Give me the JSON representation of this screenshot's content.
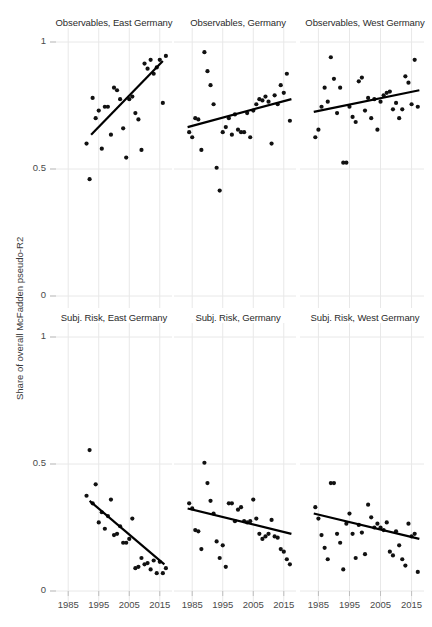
{
  "figure": {
    "width": 432,
    "height": 627,
    "background": "#ffffff",
    "point_color": "#111111",
    "line_color": "#000000",
    "grid_color": "#e8e8e8",
    "axis_color": "#bfbfbf"
  },
  "axes": {
    "ylabel": "Share of overall McFadden pseudo-R2",
    "yticks": [
      "0",
      "0.5",
      "1"
    ],
    "ytick_values": [
      0,
      0.5,
      1
    ],
    "ylim": [
      0,
      1.06
    ],
    "xticks": [
      "1985",
      "1995",
      "2005",
      "2015"
    ],
    "xtick_values": [
      1985,
      1995,
      2005,
      2015
    ],
    "xlim": [
      1981,
      2019
    ],
    "grid": true,
    "legend": "none"
  },
  "chart_data": {
    "type": "scatter",
    "title": "",
    "xlabel": "",
    "ylabel": "Share of overall McFadden pseudo-R2",
    "ylim": [
      0,
      1.06
    ],
    "xlim": [
      1981,
      2019
    ],
    "grid": true,
    "layout": {
      "rows": 2,
      "cols": 3
    },
    "panels": [
      {
        "title": "Observables, East Germany",
        "row": 0,
        "col": 0,
        "x": [
          1991,
          1992,
          1993,
          1994,
          1995,
          1996,
          1997,
          1998,
          1999,
          2000,
          2001,
          2002,
          2003,
          2004,
          2005,
          2006,
          2007,
          2008,
          2009,
          2010,
          2011,
          2012,
          2013,
          2014,
          2015,
          2016,
          2017
        ],
        "y": [
          0.6,
          0.46,
          0.78,
          0.7,
          0.73,
          0.58,
          0.745,
          0.745,
          0.635,
          0.82,
          0.81,
          0.775,
          0.66,
          0.545,
          0.775,
          0.785,
          0.72,
          0.695,
          0.575,
          0.915,
          0.895,
          0.93,
          0.875,
          0.9,
          0.93,
          0.76,
          0.945
        ],
        "trend": {
          "x0": 1992.5,
          "y0": 0.635,
          "x1": 2016.0,
          "y1": 0.925
        }
      },
      {
        "title": "Observables, Germany",
        "row": 0,
        "col": 1,
        "x": [
          1984,
          1985,
          1986,
          1987,
          1988,
          1989,
          1990,
          1991,
          1992,
          1993,
          1994,
          1995,
          1996,
          1997,
          1998,
          1999,
          2000,
          2001,
          2002,
          2003,
          2004,
          2005,
          2006,
          2007,
          2008,
          2009,
          2010,
          2011,
          2012,
          2013,
          2014,
          2015,
          2016,
          2017
        ],
        "y": [
          0.645,
          0.625,
          0.7,
          0.695,
          0.575,
          0.96,
          0.885,
          0.83,
          0.755,
          0.505,
          0.415,
          0.645,
          0.665,
          0.7,
          0.635,
          0.715,
          0.655,
          0.645,
          0.645,
          0.72,
          0.625,
          0.73,
          0.755,
          0.775,
          0.77,
          0.785,
          0.765,
          0.6,
          0.79,
          0.755,
          0.83,
          0.8,
          0.875,
          0.69
        ],
        "trend": {
          "x0": 1983.5,
          "y0": 0.665,
          "x1": 2017.5,
          "y1": 0.775
        }
      },
      {
        "title": "Observables, West Germany",
        "row": 0,
        "col": 2,
        "x": [
          1984,
          1985,
          1986,
          1987,
          1988,
          1989,
          1990,
          1991,
          1992,
          1993,
          1994,
          1995,
          1996,
          1997,
          1998,
          1999,
          2000,
          2001,
          2002,
          2003,
          2004,
          2005,
          2006,
          2007,
          2008,
          2009,
          2010,
          2011,
          2012,
          2013,
          2014,
          2015,
          2016,
          2017
        ],
        "y": [
          0.625,
          0.655,
          0.745,
          0.82,
          0.765,
          0.94,
          0.855,
          0.72,
          0.82,
          0.525,
          0.525,
          0.745,
          0.705,
          0.685,
          0.845,
          0.86,
          0.73,
          0.78,
          0.7,
          0.775,
          0.655,
          0.765,
          0.79,
          0.8,
          0.805,
          0.735,
          0.76,
          0.7,
          0.735,
          0.865,
          0.84,
          0.755,
          0.93,
          0.745
        ],
        "trend": {
          "x0": 1983.5,
          "y0": 0.725,
          "x1": 2017.5,
          "y1": 0.81
        }
      },
      {
        "title": "Subj. Risk, East Germany",
        "row": 1,
        "col": 0,
        "x": [
          1991,
          1992,
          1993,
          1994,
          1995,
          1996,
          1997,
          1998,
          1999,
          2000,
          2001,
          2002,
          2003,
          2004,
          2005,
          2006,
          2007,
          2008,
          2009,
          2010,
          2011,
          2012,
          2013,
          2014,
          2015,
          2016,
          2017
        ],
        "y": [
          0.375,
          0.555,
          0.345,
          0.42,
          0.27,
          0.31,
          0.245,
          0.295,
          0.36,
          0.22,
          0.225,
          0.255,
          0.19,
          0.19,
          0.205,
          0.285,
          0.09,
          0.095,
          0.13,
          0.105,
          0.11,
          0.085,
          0.12,
          0.07,
          0.115,
          0.07,
          0.09
        ],
        "trend": {
          "x0": 1992.0,
          "y0": 0.355,
          "x1": 2016.5,
          "y1": 0.105
        }
      },
      {
        "title": "Subj. Risk, Germany",
        "row": 1,
        "col": 1,
        "x": [
          1984,
          1985,
          1986,
          1987,
          1988,
          1989,
          1990,
          1991,
          1992,
          1993,
          1994,
          1995,
          1996,
          1997,
          1998,
          1999,
          2000,
          2001,
          2002,
          2003,
          2004,
          2005,
          2006,
          2007,
          2008,
          2009,
          2010,
          2011,
          2012,
          2013,
          2014,
          2015,
          2016,
          2017
        ],
        "y": [
          0.345,
          0.325,
          0.24,
          0.235,
          0.165,
          0.505,
          0.425,
          0.355,
          0.305,
          0.195,
          0.13,
          0.18,
          0.095,
          0.345,
          0.345,
          0.275,
          0.32,
          0.33,
          0.275,
          0.27,
          0.275,
          0.36,
          0.285,
          0.225,
          0.205,
          0.215,
          0.225,
          0.28,
          0.215,
          0.21,
          0.165,
          0.155,
          0.125,
          0.105
        ],
        "trend": {
          "x0": 1983.5,
          "y0": 0.325,
          "x1": 2017.5,
          "y1": 0.225
        }
      },
      {
        "title": "Subj. Risk, West Germany",
        "row": 1,
        "col": 2,
        "x": [
          1984,
          1985,
          1986,
          1987,
          1988,
          1989,
          1990,
          1991,
          1992,
          1993,
          1994,
          1995,
          1996,
          1997,
          1998,
          1999,
          2000,
          2001,
          2002,
          2003,
          2004,
          2005,
          2006,
          2007,
          2008,
          2009,
          2010,
          2011,
          2012,
          2013,
          2014,
          2015,
          2016,
          2017
        ],
        "y": [
          0.33,
          0.285,
          0.22,
          0.17,
          0.125,
          0.425,
          0.425,
          0.225,
          0.19,
          0.085,
          0.265,
          0.305,
          0.225,
          0.13,
          0.26,
          0.23,
          0.145,
          0.34,
          0.29,
          0.25,
          0.265,
          0.25,
          0.24,
          0.27,
          0.155,
          0.14,
          0.235,
          0.18,
          0.125,
          0.1,
          0.265,
          0.215,
          0.225,
          0.075
        ],
        "trend": {
          "x0": 1983.5,
          "y0": 0.305,
          "x1": 2017.5,
          "y1": 0.205
        }
      }
    ]
  }
}
